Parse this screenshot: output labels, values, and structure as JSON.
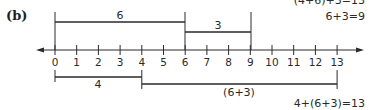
{
  "figure": {
    "part_label": "(b)",
    "equations": {
      "top_cut": "(4+6)+3=13",
      "top": "6+3=9",
      "bottom": "4+(6+3)=13"
    },
    "number_line": {
      "min": 0,
      "max": 13,
      "ticks": [
        "0",
        "1",
        "2",
        "3",
        "4",
        "5",
        "6",
        "7",
        "8",
        "9",
        "10",
        "11",
        "12",
        "13"
      ],
      "arrows": [
        "left",
        "right"
      ]
    },
    "top_segments": [
      {
        "label": "6",
        "from": 0,
        "to": 6
      },
      {
        "label": "3",
        "from": 6,
        "to": 9
      }
    ],
    "bottom_segments": [
      {
        "label": "4",
        "from": 0,
        "to": 4
      },
      {
        "label": "(6+3)",
        "from": 4,
        "to": 13
      }
    ],
    "colors": {
      "ink": "#2a2a2a",
      "background": "#ffffff"
    }
  }
}
